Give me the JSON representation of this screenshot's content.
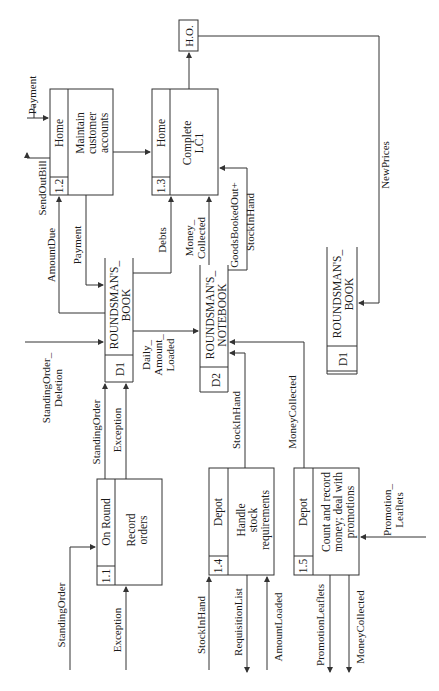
{
  "diagram": {
    "type": "data-flow-diagram",
    "orientation": "rotated-90-ccw",
    "external_entities": [
      {
        "id": "ho",
        "label": "H.O."
      }
    ],
    "processes": [
      {
        "id": "1.1",
        "location": "On Round",
        "name_line1": "Record",
        "name_line2": "orders",
        "name_line3": ""
      },
      {
        "id": "1.2",
        "location": "Home",
        "name_line1": "Maintain",
        "name_line2": "customer",
        "name_line3": "accounts"
      },
      {
        "id": "1.3",
        "location": "Home",
        "name_line1": "Complete",
        "name_line2": "LC1",
        "name_line3": ""
      },
      {
        "id": "1.4",
        "location": "Depot",
        "name_line1": "Handle",
        "name_line2": "stock",
        "name_line3": "requirements"
      },
      {
        "id": "1.5",
        "location": "Depot",
        "name_line1": "Count and record",
        "name_line2": "money; deal with",
        "name_line3": "promotions"
      }
    ],
    "data_stores": [
      {
        "id": "D1",
        "name_line1": "ROUNDSMAN'S_",
        "name_line2": "BOOK"
      },
      {
        "id": "D2",
        "name_line1": "ROUNDSMAN'S_",
        "name_line2": "NOTEBOOK"
      },
      {
        "id": "D1",
        "name_line1": "ROUNDSMAN'S_",
        "name_line2": "BOOK"
      }
    ],
    "flows": {
      "payment_in": "Payment",
      "send_out_bill": "SendOutBill",
      "amount_due": "AmountDue",
      "payment_to_book": "Payment",
      "debts": "Debts",
      "money_collected_1": "Money_",
      "money_collected_2": "Collected",
      "goods_booked_out": "GoodsBookedOut+",
      "stock_in_hand_top": "StockInHand",
      "new_prices": "NewPrices",
      "standing_order_deletion_1": "StandingOrder_",
      "standing_order_deletion_2": "Deletion",
      "standing_order_to_book": "StandingOrder",
      "exception_to_book": "Exception",
      "daily_amount_1": "Daily_",
      "daily_amount_2": "Amount_",
      "daily_amount_3": "Loaded",
      "stock_in_hand_mid": "StockInHand",
      "money_collected_mid": "MoneyCollected",
      "standing_order_in": "StandingOrder",
      "exception_in": "Exception",
      "stock_in_hand_in": "StockInHand",
      "requisition_list": "RequisitionList",
      "amount_loaded": "AmountLoaded",
      "promotion_leaflets_out": "PromotionLeaflets",
      "money_collected_out": "MoneyCollected",
      "promotion_leaflets_in_1": "Promotion_",
      "promotion_leaflets_in_2": "Leaflets"
    }
  }
}
